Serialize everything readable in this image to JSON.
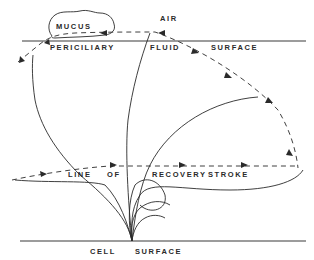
{
  "diagram": {
    "labels": {
      "mucus": "MUCUS",
      "air": "AIR",
      "periciliary": "PERICILIARY",
      "fluid": "FLUID",
      "surface_top": "SURFACE",
      "line": "LINE",
      "of": "OF",
      "recovery": "RECOVERY",
      "stroke": "STROKE",
      "cell": "CELL",
      "surface_bottom": "SURFACE"
    },
    "elements": {
      "top_surface_line": "periciliary fluid / air interface",
      "bottom_surface_line": "cell surface",
      "mucus_blob": "mucus layer resting on fluid surface",
      "effective_stroke_path": "dashed arc with arrows (tip path of effective stroke)",
      "recovery_stroke_path": "dashed line with arrows (line of recovery stroke)",
      "cilium_positions": "solid curves originating at common base point on cell surface"
    },
    "colors": {
      "ink": "#2a2a2a",
      "background": "#ffffff"
    }
  }
}
